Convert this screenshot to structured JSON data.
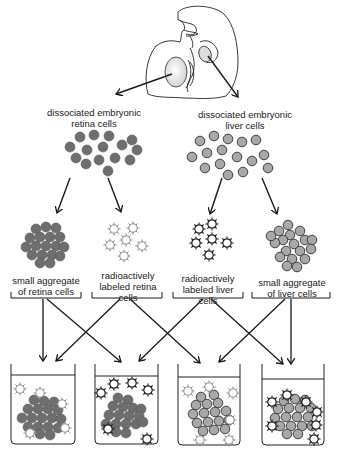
{
  "diagram": {
    "type": "experimental-procedure",
    "source": {
      "name": "embryo",
      "icon": "chick-embryo-drawing"
    },
    "top_labels": [
      {
        "id": "retina-source",
        "lines": [
          "dissociated embryonic",
          "retina cells"
        ]
      },
      {
        "id": "liver-source",
        "lines": [
          "dissociated embryonic",
          "liver cells"
        ]
      }
    ],
    "middle_labels": [
      {
        "id": "retina-aggregate",
        "lines": [
          "small aggregate",
          "of retina cells"
        ]
      },
      {
        "id": "labeled-retina",
        "lines": [
          "radioactively",
          "labeled retina",
          "cells"
        ]
      },
      {
        "id": "labeled-liver",
        "lines": [
          "radioactively",
          "labeled liver",
          "cells"
        ]
      },
      {
        "id": "liver-aggregate",
        "lines": [
          "small aggregate",
          "of liver cells"
        ]
      }
    ],
    "beakers": [
      {
        "id": "beaker-1",
        "aggregate": "retina",
        "labeled": "retina",
        "labeled_adhered": true
      },
      {
        "id": "beaker-2",
        "aggregate": "retina",
        "labeled": "liver",
        "labeled_adhered": false
      },
      {
        "id": "beaker-3",
        "aggregate": "liver",
        "labeled": "retina",
        "labeled_adhered": false
      },
      {
        "id": "beaker-4",
        "aggregate": "liver",
        "labeled": "liver",
        "labeled_adhered": true
      }
    ],
    "colors": {
      "retina_cell": "#6e6e6e",
      "liver_cell": "#a8a8a8",
      "labeled_retina_outline": "#8a8a8a",
      "labeled_liver_outline": "#2a2a2a",
      "line": "#1a1a1a"
    }
  }
}
